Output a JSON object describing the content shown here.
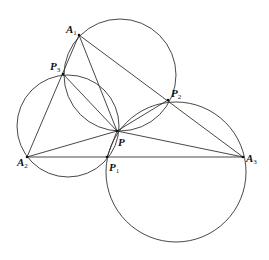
{
  "diagram": {
    "stroke": "#333333",
    "points": {
      "A1": {
        "label": "A",
        "sub": "1",
        "x": 79,
        "y": 35
      },
      "A2": {
        "label": "A",
        "sub": "2",
        "x": 27,
        "y": 157
      },
      "A3": {
        "label": "A",
        "sub": "3",
        "x": 243,
        "y": 157
      },
      "P": {
        "label": "P",
        "sub": "",
        "x": 117,
        "y": 131
      },
      "P1": {
        "label": "P",
        "sub": "1",
        "x": 107,
        "y": 157
      },
      "P2": {
        "label": "P",
        "sub": "2",
        "x": 168,
        "y": 100
      },
      "P3": {
        "label": "P",
        "sub": "3",
        "x": 63,
        "y": 74
      }
    },
    "circles": [
      {
        "name": "circle-A1-P3-P-P2",
        "cx": 120,
        "cy": 75,
        "r": 56
      },
      {
        "name": "circle-A2-P3-P-P1",
        "cx": 68,
        "cy": 126,
        "r": 51
      },
      {
        "name": "circle-A3-P1-P-P2",
        "cx": 176,
        "cy": 172,
        "r": 70
      }
    ],
    "segments": [
      [
        "A1",
        "A2"
      ],
      [
        "A1",
        "A3"
      ],
      [
        "A2",
        "A3"
      ],
      [
        "A1",
        "P"
      ],
      [
        "A2",
        "P"
      ],
      [
        "A3",
        "P"
      ],
      [
        "P3",
        "P"
      ],
      [
        "P2",
        "P"
      ],
      [
        "P1",
        "P"
      ]
    ]
  }
}
